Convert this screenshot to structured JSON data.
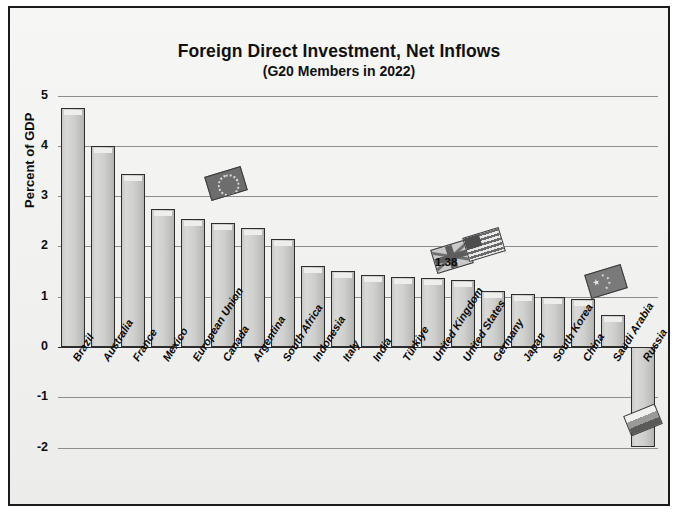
{
  "chart_data": {
    "type": "bar",
    "title": "Foreign Direct Investment, Net Inflows",
    "subtitle": "(G20 Members in 2022)",
    "xlabel": "",
    "ylabel": "Percent of GDP",
    "ylim": [
      -2,
      5
    ],
    "yticks": [
      5,
      4,
      3,
      2,
      1,
      0,
      -1,
      -2
    ],
    "ytick_labels": [
      "5",
      "4",
      "3",
      "2",
      "1",
      "0",
      "-1",
      "-2"
    ],
    "grid": true,
    "legend": "none",
    "categories": [
      "Brazil",
      "Australia",
      "France",
      "Mexico",
      "European Union",
      "Canada",
      "Argentina",
      "South Africa",
      "Indonesia",
      "Italy",
      "India",
      "Türkiye",
      "United Kingdom",
      "United States",
      "Germany",
      "Japan",
      "South Korea",
      "China",
      "Saudi Arabia",
      "Russia"
    ],
    "values": [
      4.76,
      4.0,
      3.43,
      2.75,
      2.54,
      2.47,
      2.36,
      2.14,
      1.62,
      1.52,
      1.44,
      1.4,
      1.38,
      1.33,
      1.12,
      1.06,
      1.0,
      0.95,
      0.63,
      -1.98
    ],
    "annotations": [
      {
        "text": "1.38",
        "category": "United States",
        "value": 1.38
      }
    ],
    "markers": [
      {
        "name": "european-union-flag",
        "category": "European Union"
      },
      {
        "name": "united-kingdom-flag",
        "category": "United Kingdom"
      },
      {
        "name": "united-states-flag",
        "category": "United States"
      },
      {
        "name": "china-flag",
        "category": "China"
      },
      {
        "name": "russia-flag",
        "category": "Russia"
      }
    ],
    "colors": {
      "bar_fill": "#cfcfcd",
      "bar_edge": "#2d2d2d",
      "grid": "#8d8d8d",
      "text": "#0d0d0d",
      "background": "#f3f3f1"
    }
  }
}
